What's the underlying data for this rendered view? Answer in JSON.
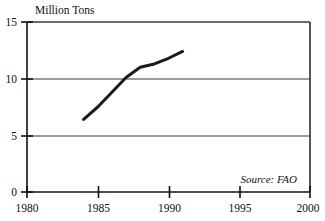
{
  "chart_data": {
    "type": "line",
    "title": "",
    "subtitle": "",
    "xlabel": "",
    "ylabel": "Million Tons",
    "unit_label": "Million Tons",
    "source_note": "Source: FAO",
    "grid": true,
    "legend": "none",
    "xlim": [
      1980,
      2000
    ],
    "ylim": [
      0,
      15
    ],
    "xticks": [
      1980,
      1985,
      1990,
      1995,
      2000
    ],
    "xtick_labels": [
      "1980",
      "1985",
      "1990",
      "1995",
      "2000"
    ],
    "yticks": [
      0,
      5,
      10,
      15
    ],
    "ytick_labels": [
      "0",
      "5",
      "10",
      "15"
    ],
    "x": [
      1984,
      1985,
      1986,
      1987,
      1988,
      1989,
      1990,
      1991
    ],
    "series": [
      {
        "name": "Production",
        "color": "#1a1a1a",
        "values": [
          6.4,
          7.5,
          8.8,
          10.1,
          11.0,
          11.3,
          11.8,
          12.4
        ]
      }
    ]
  },
  "axis": {
    "y_label_text": "Million Tons",
    "tick_0": "0",
    "tick_5": "5",
    "tick_10": "10",
    "tick_15": "15",
    "x_1980": "1980",
    "x_1985": "1985",
    "x_1990": "1990",
    "x_1995": "1995",
    "x_2000": "2000"
  },
  "annotations": {
    "source": "Source: FAO"
  },
  "colors": {
    "line": "#1a1a1a",
    "axis": "#111111",
    "grid": "#3a3a3a",
    "background": "#ffffff"
  }
}
